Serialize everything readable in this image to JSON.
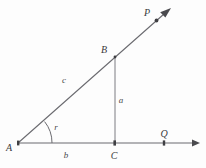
{
  "figure": {
    "background_color": "#fdfdfd",
    "line_color": "#6b6b70",
    "label_color": "#3a3a3c",
    "width": 206,
    "height": 168
  },
  "points": {
    "A": {
      "label": "A",
      "x": 18,
      "y": 143,
      "label_x": 9,
      "label_y": 151
    },
    "B": {
      "label": "B",
      "x": 115,
      "y": 57,
      "label_x": 101,
      "label_y": 53
    },
    "C": {
      "label": "C",
      "x": 115,
      "y": 143,
      "label_x": 111,
      "label_y": 157
    },
    "P": {
      "label": "P",
      "x": 157,
      "y": 20,
      "label_x": 145,
      "label_y": 16
    },
    "Q": {
      "label": "Q",
      "x": 164,
      "y": 143,
      "label_x": 160,
      "label_y": 137
    }
  },
  "segments": {
    "hypotenuse": {
      "label": "c",
      "label_x": 64,
      "label_y": 82,
      "from": "A",
      "to": "B"
    },
    "opposite": {
      "label": "a",
      "label_x": 119,
      "label_y": 103,
      "from": "B",
      "to": "C"
    },
    "adjacent": {
      "label": "b",
      "label_x": 64,
      "label_y": 157,
      "from": "A",
      "to": "C"
    }
  },
  "angle": {
    "label": "r",
    "vertex": "A",
    "label_x": 55,
    "label_y": 130,
    "radius": 34
  },
  "rays": {
    "ray_AP": {
      "name": "ray-A-to-P",
      "tip_x": 170,
      "tip_y": 10
    },
    "ray_AQ": {
      "name": "ray-A-to-Q",
      "tip_x": 199,
      "tip_y": 143
    }
  }
}
